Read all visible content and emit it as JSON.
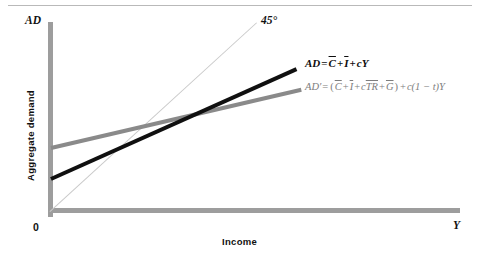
{
  "chart_data": {
    "type": "line",
    "title": "",
    "xlabel": "Income",
    "ylabel": "Aggregate demand",
    "x_axis_symbol": "Y",
    "y_axis_symbol": "AD",
    "origin_label": "0",
    "grid": false,
    "legend": "inline-annotations",
    "axis_ranges": {
      "x": [
        0,
        1
      ],
      "y": [
        0,
        1
      ]
    },
    "annotations": [
      {
        "name": "forty-five-degree",
        "text": "45°"
      }
    ],
    "series": [
      {
        "name": "45-degree line",
        "label": "45°",
        "color": "#c9c9c9",
        "style": "thin",
        "points": [
          [
            0,
            0
          ],
          [
            0.503,
            1.0
          ]
        ]
      },
      {
        "name": "AD",
        "label": "AD = C̄ + Ī + cY",
        "color": "#101010",
        "style": "thick",
        "intercept": 0.18,
        "slope": 0.58,
        "points": [
          [
            0.0,
            0.18
          ],
          [
            0.6,
            0.765
          ]
        ]
      },
      {
        "name": "AD'",
        "label": "AD' = (C̄ + Ī + cTR̄ + Ḡ) + c(1 − t)Y",
        "color": "#8a8a8a",
        "style": "thick",
        "intercept": 0.35,
        "slope": 0.31,
        "points": [
          [
            0.0,
            0.35
          ],
          [
            0.61,
            0.653
          ]
        ]
      }
    ]
  },
  "axes": {
    "y_symbol": "AD",
    "x_symbol": "Y",
    "origin": "0",
    "x_title": "Income",
    "y_title": "Aggregate demand"
  },
  "annotations": {
    "forty_five": "45°"
  },
  "equations": {
    "ad": {
      "lhs": "AD",
      "eq": "=",
      "c_bar": "C",
      "plus1": "+",
      "i_bar": "I",
      "plus2": "+",
      "cy": "cY",
      "plain": "AD = C̄ + Ī + cY"
    },
    "ad_prime": {
      "lhs": "AD′",
      "eq": "=",
      "open": "(",
      "c_bar": "C",
      "plus1": "+",
      "i_bar": "I",
      "plus2": "+",
      "c": "c",
      "tr_bar": "TR",
      "plus3": "+",
      "g_bar": "G",
      "close": ")",
      "plus4": "+",
      "tail": "c(1 − t)Y",
      "plain": "AD′ = (C̄ + Ī + cTR̄ + Ḡ) + c(1 − t)Y"
    }
  },
  "colors": {
    "axis": "#9d9d9d",
    "ad_line": "#101010",
    "ad_prime_line": "#8a8a8a",
    "reference_line": "#c9c9c9",
    "rule": "#b9b9b9"
  }
}
